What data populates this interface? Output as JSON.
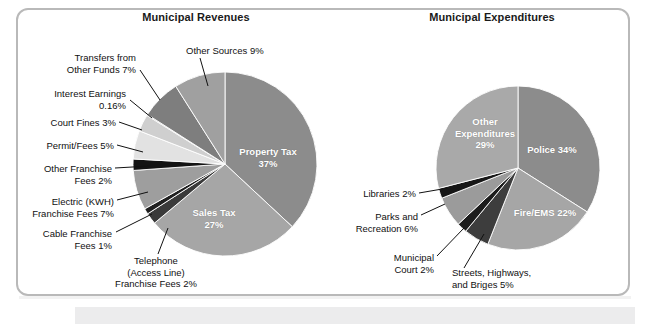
{
  "page": {
    "background": "#ffffff",
    "card_border_color": "#b9b9b9",
    "bottom_band_color": "#ececed"
  },
  "charts": [
    {
      "title": "Municipal Revenues",
      "center": [
        225,
        164
      ],
      "radius": 92,
      "start_angle": -90,
      "slices": [
        {
          "label": "Property Tax\n37%",
          "value": 37,
          "color": "#8c8c8c",
          "label_pos": "inside",
          "lx": 268,
          "ly": 152
        },
        {
          "label": "Sales Tax\n27%",
          "value": 27,
          "color": "#a6a6a6",
          "label_pos": "inside",
          "lx": 214,
          "ly": 213
        },
        {
          "label": "Telephone\n(Access Line)\nFranchise Fees 2%",
          "value": 2,
          "color": "#3a3a3a"
        },
        {
          "label": "Cable Franchise\nFees 1%",
          "value": 1,
          "color": "#1f1f1f"
        },
        {
          "label": "Electric (KWH)\nFranchise Fees 7%",
          "value": 7,
          "color": "#9e9e9e"
        },
        {
          "label": "Other Franchise\nFees 2%",
          "value": 2,
          "color": "#141414"
        },
        {
          "label": "Permit/Fees 5%",
          "value": 5,
          "color": "#e2e2e2"
        },
        {
          "label": "Court Fines 3%",
          "value": 3,
          "color": "#cfcfcf"
        },
        {
          "label": "Interest Earnings\n0.16%",
          "value": 0.16,
          "color": "#6f6f6f"
        },
        {
          "label": "Transfers from\nOther Funds 7%",
          "value": 7,
          "color": "#7e7e7e"
        },
        {
          "label": "Other Sources 9%",
          "value": 9,
          "color": "#a0a0a0"
        }
      ],
      "callouts": [
        {
          "text": "Other Sources 9%",
          "align": "left",
          "x": 186,
          "y": 45,
          "w": 120,
          "lead": [
            [
              200,
              58
            ],
            [
              208,
              86
            ]
          ]
        },
        {
          "text": "Transfers from\nOther Funds 7%",
          "align": "right",
          "x": 18,
          "y": 52,
          "w": 118,
          "lead": [
            [
              140,
              70
            ],
            [
              160,
              100
            ]
          ]
        },
        {
          "text": "Interest Earnings\n0.16%",
          "align": "right",
          "x": 14,
          "y": 88,
          "w": 112,
          "lead": [
            [
              130,
              100
            ],
            [
              152,
              118
            ]
          ]
        },
        {
          "text": "Court Fines 3%",
          "align": "right",
          "x": 8,
          "y": 117,
          "w": 108,
          "lead": [
            [
              119,
              122
            ],
            [
              142,
              130
            ]
          ]
        },
        {
          "text": "Permit/Fees 5%",
          "align": "right",
          "x": 4,
          "y": 140,
          "w": 110,
          "lead": [
            [
              117,
              145
            ],
            [
              143,
              152
            ]
          ]
        },
        {
          "text": "Other Franchise\nFees 2%",
          "align": "right",
          "x": 4,
          "y": 163,
          "w": 108,
          "lead": [
            [
              115,
              168
            ],
            [
              150,
              166
            ]
          ]
        },
        {
          "text": "Electric (KWH)\nFranchise Fees 7%",
          "align": "right",
          "x": 2,
          "y": 196,
          "w": 112,
          "lead": [
            [
              117,
              200
            ],
            [
              148,
              192
            ]
          ]
        },
        {
          "text": "Cable Franchise\nFees 1%",
          "align": "right",
          "x": 4,
          "y": 228,
          "w": 108,
          "lead": [
            [
              116,
              232
            ],
            [
              152,
              214
            ]
          ]
        },
        {
          "text": "Telephone\n(Access Line)\nFranchise Fees 2%",
          "align": "center",
          "x": 96,
          "y": 255,
          "w": 120,
          "lead": [
            [
              158,
              254
            ],
            [
              168,
              228
            ]
          ]
        }
      ]
    },
    {
      "title": "Municipal Expenditures",
      "center": [
        518,
        168
      ],
      "radius": 82,
      "start_angle": -90,
      "slices": [
        {
          "label": "Police 34%",
          "value": 34,
          "color": "#8c8c8c",
          "label_pos": "inside",
          "lx": 552,
          "ly": 150
        },
        {
          "label": "Fire/EMS 22%",
          "value": 22,
          "color": "#a6a6a6",
          "label_pos": "inside",
          "lx": 545,
          "ly": 213
        },
        {
          "label": "Streets, Highways,\nand Briges 5%",
          "value": 5,
          "color": "#3d3d3d"
        },
        {
          "label": "Municipal\nCourt 2%",
          "value": 2,
          "color": "#1c1c1c"
        },
        {
          "label": "Parks and\nRecreation 6%",
          "value": 6,
          "color": "#9b9b9b"
        },
        {
          "label": "Libraries 2%",
          "value": 2,
          "color": "#161616"
        },
        {
          "label": "Other\nExpenditures\n29%",
          "value": 29,
          "color": "#a9a9a9",
          "label_pos": "inside",
          "lx": 485,
          "ly": 122
        }
      ],
      "callouts": [
        {
          "text": "Libraries 2%",
          "align": "right",
          "x": 338,
          "y": 188,
          "w": 78,
          "lead": [
            [
              419,
              193
            ],
            [
              448,
              188
            ]
          ]
        },
        {
          "text": "Parks and\nRecreation 6%",
          "align": "right",
          "x": 332,
          "y": 211,
          "w": 86,
          "lead": [
            [
              421,
              215
            ],
            [
              445,
              204
            ]
          ]
        },
        {
          "text": "Municipal\nCourt 2%",
          "align": "right",
          "x": 362,
          "y": 252,
          "w": 72,
          "lead": [
            [
              437,
              256
            ],
            [
              464,
              228
            ]
          ]
        },
        {
          "text": "Streets, Highways,\nand Briges 5%",
          "align": "left",
          "x": 452,
          "y": 267,
          "w": 122,
          "lead": [
            [
              464,
              268
            ],
            [
              484,
              234
            ]
          ]
        }
      ]
    }
  ]
}
